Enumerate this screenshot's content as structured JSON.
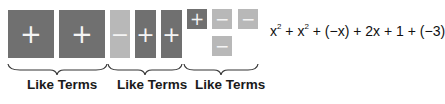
{
  "tiles": [
    {
      "kind": "x-squared",
      "sign": "+",
      "color": "dark"
    },
    {
      "kind": "x-squared",
      "sign": "+",
      "color": "dark"
    },
    {
      "kind": "x",
      "sign": "−",
      "color": "light"
    },
    {
      "kind": "x",
      "sign": "+",
      "color": "dark"
    },
    {
      "kind": "x",
      "sign": "+",
      "color": "dark"
    },
    {
      "kind": "unit",
      "sign": "+",
      "color": "dark"
    },
    {
      "kind": "unit",
      "sign": "−",
      "color": "light"
    },
    {
      "kind": "unit",
      "sign": "−",
      "color": "light"
    },
    {
      "kind": "unit",
      "sign": "−",
      "color": "light"
    }
  ],
  "groups": [
    {
      "label": "Like Terms"
    },
    {
      "label": "Like Terms"
    },
    {
      "label": "Like Terms"
    }
  ],
  "expression": {
    "t1": "x",
    "e1": "2",
    "op1": " + ",
    "t2": "x",
    "e2": "2",
    "op2": " + ",
    "t3": "(−x)",
    "op3": " + ",
    "t4": "2x",
    "op4": " + ",
    "t5": "1",
    "op5": " + ",
    "t6": "(−3)"
  },
  "colors": {
    "dark": "#707070",
    "light": "#b8b8b8"
  }
}
